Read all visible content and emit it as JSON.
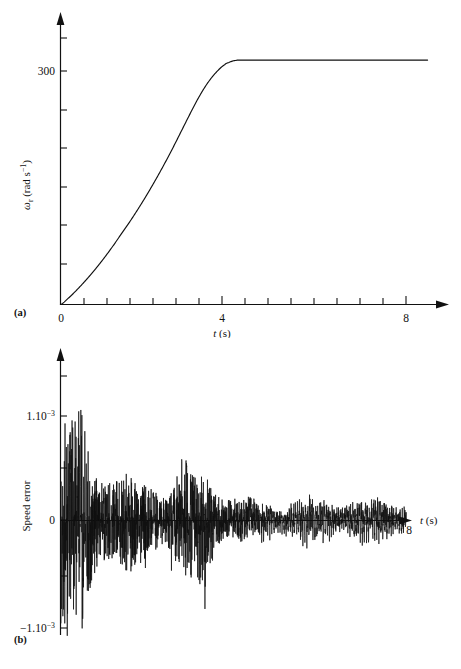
{
  "figure": {
    "background": "#ffffff",
    "ink": "#111111",
    "panels": [
      {
        "tag": "(a)",
        "name": "rotor-speed-response"
      },
      {
        "tag": "(b)",
        "name": "speed-error-response"
      }
    ]
  },
  "panel_a": {
    "tag": "(a)",
    "ylabel_main": "ω",
    "ylabel_sub": "r",
    "ylabel_units": " (rad s",
    "ylabel_exp": "−1",
    "ylabel_close": ")",
    "xlabel_symbol": "t",
    "xlabel_units": " (s)",
    "ytick_labels": [
      "300"
    ],
    "xtick_labels": [
      "0",
      "4",
      "8"
    ]
  },
  "panel_b": {
    "tag": "(b)",
    "ylabel": "Speed error",
    "xlabel_symbol": "t",
    "xlabel_units": " (s)",
    "ytick_top_mantissa": "1.10",
    "ytick_top_exp": "−3",
    "ytick_zero": "0",
    "ytick_bot_mantissa": "−1.10",
    "ytick_bot_exp": "−3",
    "xtick_labels": [
      "8"
    ]
  },
  "chart_data": [
    {
      "type": "line",
      "name": "panel-a-rotor-speed",
      "title": "",
      "xlabel": "t (s)",
      "ylabel": "ωr (rad s−1)",
      "xlim": [
        0,
        8.6
      ],
      "ylim": [
        0,
        360
      ],
      "xticks": [
        0,
        0.5,
        1,
        1.5,
        2,
        2.5,
        3,
        3.5,
        4,
        4.5,
        5,
        5.5,
        6,
        6.5,
        7,
        7.5,
        8
      ],
      "xtick_labels": {
        "0": "0",
        "4": "4",
        "8": "8"
      },
      "yticks": [
        0,
        45,
        90,
        135,
        180,
        225,
        270,
        300,
        315,
        345
      ],
      "ytick_labels": {
        "300": "300"
      },
      "grid": false,
      "legend": null,
      "series": [
        {
          "name": "rotor speed ωr",
          "comment": "S-shaped speed ramp saturating near 314 rad/s at t≈4.1 s",
          "x": [
            0,
            0.2,
            0.4,
            0.6,
            0.8,
            1.0,
            1.2,
            1.4,
            1.6,
            1.8,
            2.0,
            2.2,
            2.4,
            2.6,
            2.8,
            3.0,
            3.2,
            3.4,
            3.6,
            3.8,
            3.9,
            4.0,
            4.05,
            4.1,
            4.2,
            4.4,
            4.8,
            5.4,
            6.0,
            7.0,
            8.0,
            8.5
          ],
          "y": [
            0,
            9,
            20,
            32,
            45,
            59,
            74,
            90,
            106,
            123,
            141,
            160,
            180,
            201,
            223,
            245,
            266,
            284,
            298,
            308,
            311,
            313,
            313.5,
            314,
            314,
            314,
            314,
            314,
            314,
            314,
            314,
            314
          ]
        }
      ]
    },
    {
      "type": "line",
      "name": "panel-b-speed-error",
      "title": "",
      "xlabel": "t (s)",
      "ylabel": "Speed error",
      "xlim": [
        0,
        8.6
      ],
      "ylim": [
        -0.0013,
        0.0015
      ],
      "yticks": [
        -0.001,
        -0.0005,
        0,
        0.0005,
        0.001
      ],
      "ytick_labels": {
        "0.001": "1.10−3",
        "0": "0",
        "-0.001": "−1.10−3"
      },
      "xtick_labels": {
        "8": "8"
      },
      "grid": false,
      "legend": null,
      "series": [
        {
          "name": "speed error",
          "comment": "Broadband noise; envelope ~±1.1e-3 for t<1, decaying to ~±2.5e-4 periodic ripple for t>4.2",
          "envelope_x": [
            0.0,
            0.25,
            0.5,
            0.75,
            1.0,
            1.3,
            1.6,
            1.9,
            2.2,
            2.5,
            2.8,
            3.1,
            3.4,
            3.7,
            4.0,
            4.2,
            4.5,
            5.0,
            5.5,
            6.0,
            6.5,
            7.0,
            7.5,
            8.0
          ],
          "envelope_pos": [
            0.00108,
            0.00105,
            0.0012,
            0.00075,
            0.00062,
            0.0005,
            0.00046,
            0.00042,
            0.00048,
            0.0004,
            0.0007,
            0.00044,
            0.00052,
            0.00038,
            0.0003,
            0.00026,
            0.00028,
            0.0003,
            0.00032,
            0.0003,
            0.00031,
            0.0003,
            0.00028,
            0.0003
          ],
          "envelope_neg": [
            -0.00115,
            -0.00112,
            -0.00118,
            -0.00086,
            -0.00068,
            -0.00058,
            -0.0005,
            -0.00046,
            -0.00052,
            -0.00044,
            -0.0006,
            -0.0005,
            -0.0009,
            -0.0004,
            -0.00026,
            -0.00024,
            -0.00026,
            -0.00028,
            -0.0003,
            -0.00028,
            -0.00029,
            -0.00028,
            -0.00026,
            -0.00028
          ]
        }
      ]
    }
  ]
}
